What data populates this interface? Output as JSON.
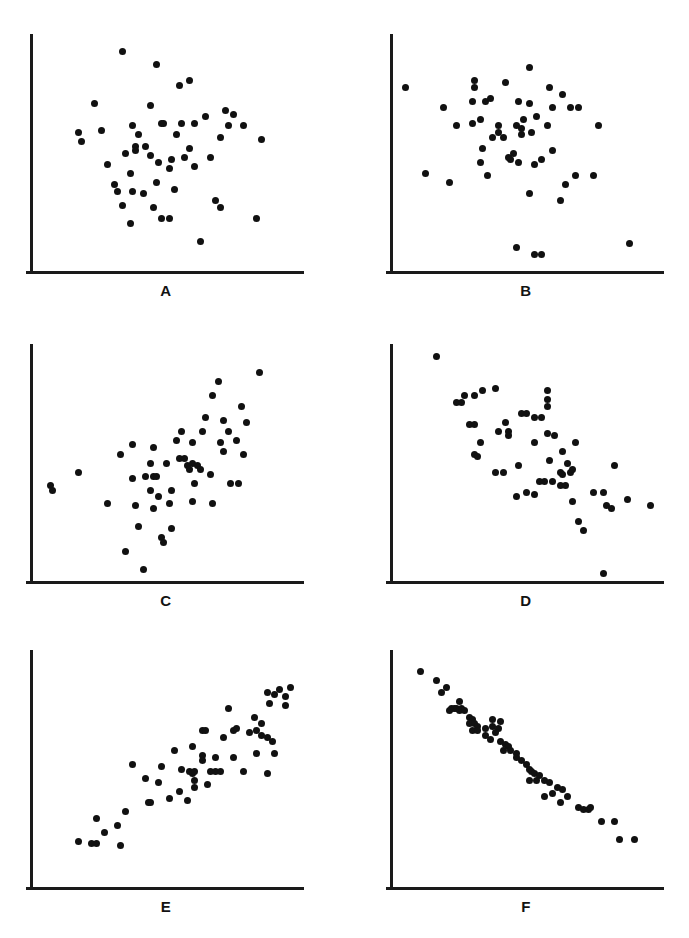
{
  "figure": {
    "title": "",
    "background_color": "#ffffff",
    "point_color": "#111111",
    "axis_color": "#1a1a1a",
    "grid": false,
    "width": 689,
    "height": 938
  },
  "chart_data": [
    {
      "type": "scatter",
      "id": "panel-a",
      "label": "A",
      "title": "",
      "xlabel": "",
      "ylabel": "",
      "xlim": [
        0,
        100
      ],
      "ylim": [
        0,
        100
      ],
      "grid": false,
      "legend": "none",
      "n_points": 52,
      "correlation": "none (r about 0.0)",
      "points": [
        [
          32,
          95
        ],
        [
          45,
          89
        ],
        [
          54,
          80
        ],
        [
          58,
          82
        ],
        [
          21,
          72
        ],
        [
          43,
          71
        ],
        [
          72,
          69
        ],
        [
          75,
          67
        ],
        [
          64,
          66
        ],
        [
          15,
          59
        ],
        [
          36,
          62
        ],
        [
          38,
          58
        ],
        [
          37,
          53
        ],
        [
          41,
          53
        ],
        [
          47,
          63
        ],
        [
          48,
          63
        ],
        [
          55,
          63
        ],
        [
          60,
          63
        ],
        [
          53,
          58
        ],
        [
          73,
          62
        ],
        [
          79,
          62
        ],
        [
          70,
          57
        ],
        [
          86,
          56
        ],
        [
          16,
          55
        ],
        [
          33,
          50
        ],
        [
          37,
          51
        ],
        [
          43,
          49
        ],
        [
          46,
          46
        ],
        [
          51,
          47
        ],
        [
          50,
          43
        ],
        [
          56,
          48
        ],
        [
          60,
          44
        ],
        [
          35,
          41
        ],
        [
          29,
          36
        ],
        [
          30,
          33
        ],
        [
          36,
          33
        ],
        [
          40,
          32
        ],
        [
          45,
          37
        ],
        [
          52,
          34
        ],
        [
          68,
          29
        ],
        [
          70,
          26
        ],
        [
          32,
          27
        ],
        [
          44,
          26
        ],
        [
          47,
          21
        ],
        [
          50,
          21
        ],
        [
          35,
          19
        ],
        [
          84,
          21
        ],
        [
          62,
          11
        ],
        [
          26,
          45
        ],
        [
          24,
          60
        ],
        [
          66,
          48
        ],
        [
          58,
          52
        ]
      ]
    },
    {
      "type": "scatter",
      "id": "panel-b",
      "label": "B",
      "title": "",
      "xlabel": "",
      "ylabel": "",
      "xlim": [
        0,
        100
      ],
      "ylim": [
        0,
        100
      ],
      "grid": false,
      "legend": "none",
      "n_points": 52,
      "correlation": "weak negative (r about -0.2)",
      "points": [
        [
          50,
          88
        ],
        [
          2,
          79
        ],
        [
          29,
          82
        ],
        [
          29,
          79
        ],
        [
          41,
          81
        ],
        [
          58,
          79
        ],
        [
          63,
          76
        ],
        [
          28,
          73
        ],
        [
          33,
          73
        ],
        [
          35,
          74
        ],
        [
          46,
          73
        ],
        [
          50,
          72
        ],
        [
          59,
          70
        ],
        [
          66,
          70
        ],
        [
          69,
          70
        ],
        [
          17,
          70
        ],
        [
          31,
          65
        ],
        [
          28,
          63
        ],
        [
          48,
          65
        ],
        [
          53,
          66
        ],
        [
          22,
          62
        ],
        [
          38,
          62
        ],
        [
          38,
          59
        ],
        [
          45,
          62
        ],
        [
          47,
          61
        ],
        [
          47,
          58
        ],
        [
          51,
          59
        ],
        [
          57,
          62
        ],
        [
          77,
          62
        ],
        [
          32,
          52
        ],
        [
          44,
          50
        ],
        [
          42,
          48
        ],
        [
          43,
          47
        ],
        [
          46,
          46
        ],
        [
          59,
          51
        ],
        [
          52,
          45
        ],
        [
          31,
          46
        ],
        [
          55,
          47
        ],
        [
          34,
          40
        ],
        [
          10,
          41
        ],
        [
          68,
          40
        ],
        [
          75,
          40
        ],
        [
          64,
          36
        ],
        [
          19,
          37
        ],
        [
          50,
          32
        ],
        [
          62,
          29
        ],
        [
          45,
          8
        ],
        [
          52,
          5
        ],
        [
          55,
          5
        ],
        [
          89,
          10
        ],
        [
          36,
          57
        ],
        [
          40,
          57
        ]
      ]
    },
    {
      "type": "scatter",
      "id": "panel-c",
      "label": "C",
      "title": "",
      "xlabel": "",
      "ylabel": "",
      "xlim": [
        0,
        100
      ],
      "ylim": [
        0,
        100
      ],
      "grid": false,
      "legend": "none",
      "n_points": 54,
      "correlation": "moderate positive (r about 0.5)",
      "points": [
        [
          85,
          90
        ],
        [
          69,
          86
        ],
        [
          67,
          80
        ],
        [
          78,
          75
        ],
        [
          71,
          69
        ],
        [
          80,
          68
        ],
        [
          55,
          64
        ],
        [
          63,
          64
        ],
        [
          53,
          60
        ],
        [
          59,
          59
        ],
        [
          70,
          59
        ],
        [
          76,
          60
        ],
        [
          36,
          58
        ],
        [
          44,
          57
        ],
        [
          31,
          54
        ],
        [
          71,
          55
        ],
        [
          79,
          54
        ],
        [
          57,
          49
        ],
        [
          59,
          50
        ],
        [
          61,
          49
        ],
        [
          58,
          47
        ],
        [
          62,
          47
        ],
        [
          43,
          50
        ],
        [
          49,
          50
        ],
        [
          15,
          46
        ],
        [
          41,
          44
        ],
        [
          44,
          44
        ],
        [
          45,
          44
        ],
        [
          60,
          41
        ],
        [
          74,
          41
        ],
        [
          77,
          41
        ],
        [
          36,
          43
        ],
        [
          4,
          40
        ],
        [
          5,
          38
        ],
        [
          43,
          38
        ],
        [
          51,
          38
        ],
        [
          26,
          32
        ],
        [
          44,
          30
        ],
        [
          50,
          32
        ],
        [
          59,
          33
        ],
        [
          67,
          32
        ],
        [
          37,
          31
        ],
        [
          38,
          22
        ],
        [
          51,
          21
        ],
        [
          47,
          17
        ],
        [
          48,
          15
        ],
        [
          33,
          11
        ],
        [
          40,
          3
        ],
        [
          64,
          70
        ],
        [
          66,
          45
        ],
        [
          54,
          52
        ],
        [
          56,
          52
        ],
        [
          46,
          35
        ],
        [
          73,
          64
        ]
      ]
    },
    {
      "type": "scatter",
      "id": "panel-d",
      "label": "D",
      "title": "",
      "xlabel": "",
      "ylabel": "",
      "xlim": [
        0,
        100
      ],
      "ylim": [
        0,
        100
      ],
      "grid": false,
      "legend": "none",
      "n_points": 56,
      "correlation": "moderate negative (r about -0.5)",
      "points": [
        [
          14,
          97
        ],
        [
          25,
          80
        ],
        [
          29,
          80
        ],
        [
          32,
          82
        ],
        [
          37,
          83
        ],
        [
          22,
          77
        ],
        [
          24,
          77
        ],
        [
          57,
          82
        ],
        [
          57,
          78
        ],
        [
          57,
          75
        ],
        [
          47,
          72
        ],
        [
          49,
          72
        ],
        [
          52,
          70
        ],
        [
          55,
          70
        ],
        [
          41,
          68
        ],
        [
          27,
          67
        ],
        [
          29,
          67
        ],
        [
          38,
          64
        ],
        [
          42,
          64
        ],
        [
          42,
          62
        ],
        [
          57,
          63
        ],
        [
          60,
          62
        ],
        [
          52,
          59
        ],
        [
          68,
          59
        ],
        [
          31,
          59
        ],
        [
          29,
          54
        ],
        [
          30,
          53
        ],
        [
          63,
          55
        ],
        [
          46,
          49
        ],
        [
          65,
          50
        ],
        [
          83,
          49
        ],
        [
          37,
          46
        ],
        [
          40,
          46
        ],
        [
          62,
          46
        ],
        [
          63,
          45
        ],
        [
          66,
          46
        ],
        [
          67,
          47
        ],
        [
          56,
          42
        ],
        [
          59,
          42
        ],
        [
          62,
          40
        ],
        [
          64,
          40
        ],
        [
          54,
          42
        ],
        [
          49,
          37
        ],
        [
          45,
          35
        ],
        [
          52,
          36
        ],
        [
          75,
          37
        ],
        [
          79,
          37
        ],
        [
          67,
          33
        ],
        [
          88,
          34
        ],
        [
          80,
          31
        ],
        [
          82,
          30
        ],
        [
          97,
          31
        ],
        [
          69,
          24
        ],
        [
          71,
          20
        ],
        [
          79,
          1
        ],
        [
          58,
          51
        ]
      ]
    },
    {
      "type": "scatter",
      "id": "panel-e",
      "label": "E",
      "title": "",
      "xlabel": "",
      "ylabel": "",
      "xlim": [
        0,
        100
      ],
      "ylim": [
        0,
        100
      ],
      "grid": false,
      "legend": "none",
      "n_points": 57,
      "correlation": "strong positive (r about 0.9)",
      "points": [
        [
          88,
          84
        ],
        [
          91,
          83
        ],
        [
          93,
          85
        ],
        [
          95,
          82
        ],
        [
          97,
          86
        ],
        [
          89,
          79
        ],
        [
          95,
          78
        ],
        [
          73,
          77
        ],
        [
          83,
          73
        ],
        [
          86,
          70
        ],
        [
          63,
          67
        ],
        [
          64,
          67
        ],
        [
          75,
          67
        ],
        [
          76,
          68
        ],
        [
          81,
          66
        ],
        [
          84,
          67
        ],
        [
          86,
          65
        ],
        [
          88,
          64
        ],
        [
          90,
          62
        ],
        [
          52,
          58
        ],
        [
          63,
          56
        ],
        [
          63,
          54
        ],
        [
          68,
          55
        ],
        [
          75,
          55
        ],
        [
          91,
          57
        ],
        [
          88,
          48
        ],
        [
          47,
          51
        ],
        [
          55,
          50
        ],
        [
          58,
          49
        ],
        [
          59,
          48
        ],
        [
          60,
          49
        ],
        [
          66,
          49
        ],
        [
          68,
          49
        ],
        [
          70,
          49
        ],
        [
          79,
          49
        ],
        [
          41,
          46
        ],
        [
          60,
          45
        ],
        [
          60,
          42
        ],
        [
          65,
          43
        ],
        [
          54,
          40
        ],
        [
          50,
          37
        ],
        [
          42,
          35
        ],
        [
          43,
          35
        ],
        [
          57,
          36
        ],
        [
          33,
          31
        ],
        [
          22,
          28
        ],
        [
          30,
          25
        ],
        [
          25,
          22
        ],
        [
          15,
          18
        ],
        [
          20,
          17
        ],
        [
          22,
          17
        ],
        [
          31,
          16
        ],
        [
          36,
          52
        ],
        [
          46,
          44
        ],
        [
          59,
          60
        ],
        [
          71,
          64
        ],
        [
          84,
          57
        ]
      ]
    },
    {
      "type": "scatter",
      "id": "panel-f",
      "label": "F",
      "title": "",
      "xlabel": "",
      "ylabel": "",
      "xlim": [
        0,
        100
      ],
      "ylim": [
        0,
        100
      ],
      "grid": false,
      "legend": "none",
      "n_points": 58,
      "correlation": "very strong negative (r about -0.98)",
      "points": [
        [
          8,
          93
        ],
        [
          14,
          89
        ],
        [
          18,
          86
        ],
        [
          16,
          84
        ],
        [
          23,
          80
        ],
        [
          20,
          77
        ],
        [
          21,
          77
        ],
        [
          22,
          77
        ],
        [
          23,
          76
        ],
        [
          24,
          77
        ],
        [
          25,
          76
        ],
        [
          19,
          76
        ],
        [
          27,
          73
        ],
        [
          28,
          72
        ],
        [
          27,
          70
        ],
        [
          29,
          70
        ],
        [
          30,
          69
        ],
        [
          28,
          67
        ],
        [
          30,
          67
        ],
        [
          36,
          72
        ],
        [
          39,
          71
        ],
        [
          36,
          69
        ],
        [
          38,
          68
        ],
        [
          37,
          66
        ],
        [
          33,
          65
        ],
        [
          35,
          63
        ],
        [
          39,
          62
        ],
        [
          41,
          61
        ],
        [
          42,
          60
        ],
        [
          40,
          58
        ],
        [
          43,
          58
        ],
        [
          45,
          57
        ],
        [
          47,
          54
        ],
        [
          49,
          52
        ],
        [
          50,
          50
        ],
        [
          51,
          49
        ],
        [
          52,
          48
        ],
        [
          54,
          47
        ],
        [
          50,
          45
        ],
        [
          53,
          45
        ],
        [
          56,
          45
        ],
        [
          58,
          44
        ],
        [
          61,
          42
        ],
        [
          63,
          41
        ],
        [
          59,
          39
        ],
        [
          65,
          38
        ],
        [
          56,
          38
        ],
        [
          62,
          35
        ],
        [
          69,
          33
        ],
        [
          71,
          32
        ],
        [
          73,
          32
        ],
        [
          74,
          33
        ],
        [
          78,
          27
        ],
        [
          83,
          27
        ],
        [
          85,
          19
        ],
        [
          91,
          19
        ],
        [
          33,
          68
        ],
        [
          45,
          55
        ]
      ]
    }
  ],
  "panels": {
    "a": {
      "label": "A"
    },
    "b": {
      "label": "B"
    },
    "c": {
      "label": "C"
    },
    "d": {
      "label": "D"
    },
    "e": {
      "label": "E"
    },
    "f": {
      "label": "F"
    }
  }
}
